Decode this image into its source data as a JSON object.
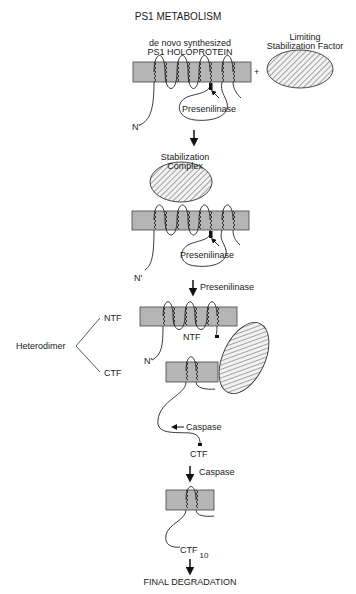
{
  "title": "PS1 METABOLISM",
  "colors": {
    "membrane": "#b5b5b5",
    "line": "#222222",
    "hatch_bg": "#f2f2f2"
  },
  "stage1": {
    "label_line1": "de novo synthesized",
    "label_line2": "PS1 HOLOPROTEIN",
    "factor_line1": "Limiting",
    "factor_line2": "Stabilization Factor",
    "plus": "+",
    "enzyme": "Presenilinase",
    "n_term": "N'"
  },
  "stage2": {
    "label_line1": "Stabilization",
    "label_line2": "Complex",
    "enzyme": "Presenilinase",
    "n_term": "N'"
  },
  "arrow_labels": {
    "presenilinase": "Presenilinase",
    "caspase_inline": "Caspase",
    "caspase_step": "Caspase"
  },
  "stage3": {
    "heterodimer": "Heterodimer",
    "ntf_branch": "NTF",
    "ctf_branch": "CTF",
    "ntf_inner": "NTF",
    "n_term": "N'"
  },
  "stage4": {
    "ctf": "CTF"
  },
  "stage5": {
    "ctf10_main": "CTF",
    "ctf10_sub": "10",
    "final": "FINAL DEGRADATION"
  }
}
